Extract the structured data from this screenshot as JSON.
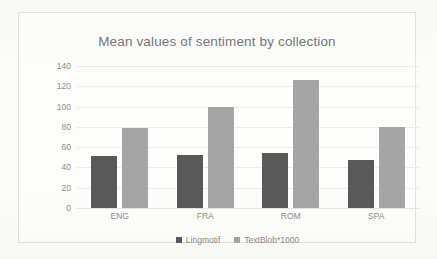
{
  "chart_data": {
    "type": "bar",
    "title": "Mean values of sentiment by collection",
    "xlabel": "",
    "ylabel": "",
    "categories": [
      "ENG",
      "FRA",
      "ROM",
      "SPA"
    ],
    "series": [
      {
        "name": "Lingmotif",
        "color": "#595959",
        "values": [
          51,
          52,
          54,
          47
        ]
      },
      {
        "name": "TextBlob*1000",
        "color": "#a5a5a5",
        "values": [
          79,
          100,
          126,
          80
        ]
      }
    ],
    "ylim": [
      0,
      140
    ],
    "yticks": [
      0,
      20,
      40,
      60,
      80,
      100,
      120,
      140
    ],
    "ytick_labels": [
      "0",
      "20",
      "40",
      "60",
      "80",
      "100",
      "120",
      "140"
    ],
    "grid": true,
    "legend_position": "bottom"
  },
  "legend": {
    "items": [
      {
        "label": "Lingmotif"
      },
      {
        "label": "TextBlob*1000"
      }
    ]
  }
}
